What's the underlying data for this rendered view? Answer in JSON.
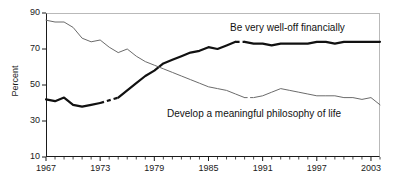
{
  "chart_data": {
    "type": "line",
    "title": "",
    "xlabel": "",
    "ylabel": "Percent",
    "xlim": [
      1967,
      2004
    ],
    "ylim": [
      10,
      90
    ],
    "ytick_values": [
      90,
      70,
      50,
      30,
      10
    ],
    "ytick_labels": [
      "90",
      "70",
      "50",
      "30",
      "10"
    ],
    "xtick_values": [
      1967,
      1973,
      1979,
      1985,
      1991,
      1997,
      2003
    ],
    "xtick_labels": [
      "1967",
      "1973",
      "1979",
      "1985",
      "1991",
      "1997",
      "2003"
    ],
    "minor_xticks_every": 1,
    "grid": false,
    "legend_position": "inline-annotations",
    "series": [
      {
        "name": "Be very well-off financially",
        "style": "bold",
        "color": "#111111",
        "gap_years": [
          [
            1973,
            1975
          ],
          [
            1988,
            1989
          ]
        ],
        "x": [
          1967,
          1968,
          1969,
          1970,
          1971,
          1972,
          1973,
          1975,
          1976,
          1977,
          1978,
          1979,
          1980,
          1981,
          1982,
          1983,
          1984,
          1985,
          1986,
          1987,
          1988,
          1989,
          1990,
          1991,
          1992,
          1993,
          1994,
          1995,
          1996,
          1997,
          1998,
          1999,
          2000,
          2001,
          2002,
          2003,
          2004
        ],
        "values": [
          42,
          41,
          43,
          39,
          38,
          39,
          40,
          43,
          47,
          51,
          55,
          58,
          62,
          64,
          66,
          68,
          69,
          71,
          70,
          72,
          74,
          74,
          73,
          73,
          72,
          73,
          73,
          73,
          73,
          74,
          74,
          73,
          74,
          74,
          74,
          74,
          74
        ]
      },
      {
        "name": "Develop a meaningful philosophy of life",
        "style": "thin",
        "color": "#6b6b6b",
        "gap_years": [
          [
            1989,
            1990
          ]
        ],
        "x": [
          1967,
          1968,
          1969,
          1970,
          1971,
          1972,
          1973,
          1974,
          1975,
          1976,
          1977,
          1978,
          1979,
          1980,
          1981,
          1982,
          1983,
          1984,
          1985,
          1986,
          1987,
          1988,
          1989,
          1990,
          1991,
          1992,
          1993,
          1994,
          1995,
          1996,
          1997,
          1998,
          1999,
          2000,
          2001,
          2002,
          2003,
          2004
        ],
        "values": [
          86,
          85,
          85,
          82,
          76,
          74,
          75,
          71,
          68,
          70,
          66,
          63,
          61,
          59,
          57,
          55,
          53,
          51,
          49,
          48,
          47,
          45,
          43,
          43,
          44,
          46,
          48,
          47,
          46,
          45,
          44,
          44,
          44,
          43,
          43,
          42,
          43,
          39
        ]
      }
    ],
    "annotations": [
      {
        "text": "Be very well-off financially",
        "for_series": 0
      },
      {
        "text": "Develop a meaningful philosophy of life",
        "for_series": 1
      }
    ]
  },
  "axes": {
    "y_title": "Percent"
  }
}
